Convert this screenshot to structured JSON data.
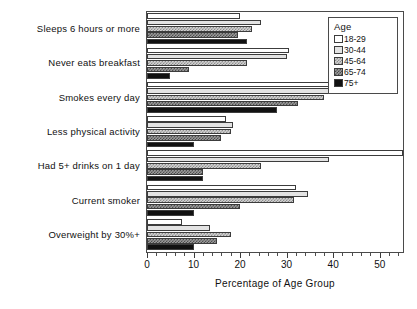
{
  "chart_data": {
    "type": "bar",
    "orientation": "horizontal",
    "title": "",
    "xlabel": "Percentage of Age Group",
    "ylabel": "",
    "xlim": [
      0,
      55
    ],
    "ylim": null,
    "grid": false,
    "xticks": [
      0,
      10,
      20,
      30,
      40,
      50
    ],
    "xtick_labels": [
      "0",
      "10",
      "20",
      "30",
      "40",
      "50"
    ],
    "minor_tick_step": 2,
    "legend": {
      "title": "Age",
      "position": "top-right",
      "entries": [
        "18-29",
        "30-44",
        "45-64",
        "65-74",
        "75+"
      ]
    },
    "categories": [
      "Sleeps 6 hours or more",
      "Never eats breakfast",
      "Smokes every day",
      "Less physical activity",
      "Had 5+ drinks on 1 day",
      "Current smoker",
      "Overweight by 30%+"
    ],
    "series": [
      {
        "name": "18-29",
        "fill": "white",
        "color": "#ffffff",
        "values": [
          20.0,
          30.5,
          42.0,
          17.0,
          55.0,
          32.0,
          7.5
        ]
      },
      {
        "name": "30-44",
        "fill": "light-gray",
        "color": "#e3e3e3",
        "values": [
          24.5,
          30.0,
          41.5,
          18.5,
          39.0,
          34.5,
          13.5
        ]
      },
      {
        "name": "45-64",
        "fill": "light-checker",
        "color": "#d2d2d2",
        "values": [
          22.5,
          21.5,
          38.0,
          18.0,
          24.5,
          31.5,
          18.0
        ]
      },
      {
        "name": "65-74",
        "fill": "dark-checker",
        "color": "#9a9a9a",
        "values": [
          19.5,
          9.0,
          32.5,
          16.0,
          12.0,
          20.0,
          15.0
        ]
      },
      {
        "name": "75+",
        "fill": "solid-black",
        "color": "#111111",
        "values": [
          21.5,
          5.0,
          28.0,
          10.0,
          12.0,
          10.0,
          10.0
        ]
      }
    ]
  }
}
